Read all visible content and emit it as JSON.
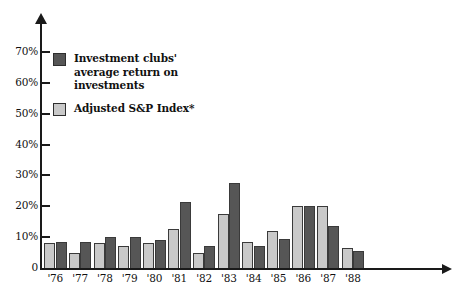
{
  "chart_data": {
    "type": "bar",
    "title": "",
    "subtitle": "",
    "xlabel": "",
    "ylabel": "",
    "categories": [
      "'76",
      "'77",
      "'78",
      "'79",
      "'80",
      "'81",
      "'82",
      "'83",
      "'84",
      "'85",
      "'86",
      "'87",
      "'88"
    ],
    "series": [
      {
        "name": "Adjusted S&P Index*",
        "color": "#c9c9c9",
        "values": [
          8,
          5,
          8,
          7,
          8,
          12.5,
          5,
          17.5,
          8.5,
          12,
          20,
          20,
          6.5
        ]
      },
      {
        "name": "Investment clubs' average return on investments",
        "color": "#565656",
        "values": [
          8.5,
          8.5,
          10,
          10,
          9,
          21.5,
          7,
          27.5,
          7,
          9.5,
          20,
          13.5,
          5.5
        ]
      }
    ],
    "ylim": [
      0,
      75
    ],
    "yticks": [
      0,
      10,
      20,
      30,
      40,
      50,
      60,
      70
    ],
    "ytick_labels": [
      "0",
      "10%",
      "20%",
      "30%",
      "40%",
      "50%",
      "60%",
      "70%"
    ],
    "grid": false,
    "legend_position": "upper-left-inside"
  },
  "legend": {
    "items": [
      {
        "label": "Investment clubs'\naverage return on\ninvestments",
        "swatch": "dark"
      },
      {
        "label": "Adjusted S&P Index*",
        "swatch": "light"
      }
    ]
  },
  "axes": {
    "y_tick_labels": [
      "70%",
      "60%",
      "50%",
      "40%",
      "30%",
      "20%",
      "10%",
      "0"
    ],
    "x_tick_labels": [
      "'76",
      "'77",
      "'78",
      "'79",
      "'80",
      "'81",
      "'82",
      "'83",
      "'84",
      "'85",
      "'86",
      "'87",
      "'88"
    ]
  }
}
